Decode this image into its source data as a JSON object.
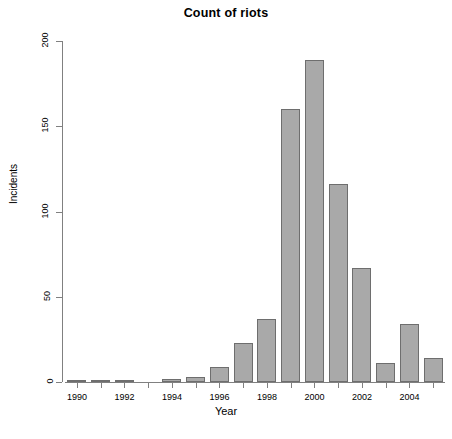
{
  "chart_data": {
    "type": "bar",
    "title": "Count of riots",
    "xlabel": "Year",
    "ylabel": "Incidents",
    "categories": [
      "1990",
      "1991",
      "1992",
      "1993",
      "1994",
      "1995",
      "1996",
      "1997",
      "1998",
      "1999",
      "2000",
      "2001",
      "2002",
      "2003",
      "2004",
      "2005"
    ],
    "values": [
      1,
      1,
      1,
      0,
      2,
      3,
      9,
      23,
      37,
      160,
      189,
      116,
      67,
      11,
      34,
      14
    ],
    "ylim": [
      0,
      200
    ],
    "yticks": [
      0,
      50,
      100,
      150,
      200
    ],
    "ytick_labels": [
      "0",
      "50",
      "100",
      "150",
      "200"
    ],
    "xtick_labels": [
      "1990",
      "",
      "1992",
      "",
      "1994",
      "",
      "1996",
      "",
      "1998",
      "",
      "2000",
      "",
      "2002",
      "",
      "2004",
      ""
    ],
    "grid": false,
    "legend": false,
    "bar_color": "#a9a9a9",
    "bar_border_color": "#6e6e6e",
    "axis_color": "#808080"
  }
}
